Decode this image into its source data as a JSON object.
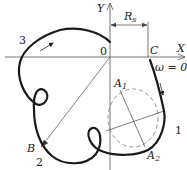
{
  "diagram": {
    "axes": {
      "x_label": "X",
      "y_label": "Y",
      "origin_label": "0"
    },
    "points": {
      "C": "C",
      "B": "B",
      "A1_main": "A",
      "A1_sub": "1",
      "A2_main": "A",
      "A2_sub": "2"
    },
    "radius_label_main": "R",
    "radius_label_sub": "s",
    "omega_label": "ω = 0",
    "segment_labels": [
      "1",
      "2",
      "3"
    ],
    "colors": {
      "curve": "#1a1a1a",
      "axes": "#555555",
      "dashed_circle": "#777777",
      "text": "#222222"
    }
  }
}
